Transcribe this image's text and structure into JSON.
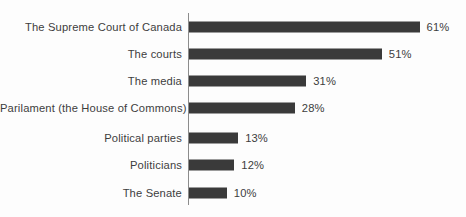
{
  "chart_data": {
    "type": "bar",
    "orientation": "horizontal",
    "title": "",
    "subtitle": "",
    "xlabel": "",
    "ylabel": "",
    "grid": false,
    "legend": null,
    "axis_line": true,
    "value_suffix": "%",
    "xlim": [
      0,
      61
    ],
    "categories": [
      "The Supreme Court of Canada",
      "The courts",
      "The media",
      "Parilament (the House of Commons)",
      "Political parties",
      "Politicians",
      "The Senate"
    ],
    "values": [
      61,
      51,
      31,
      28,
      13,
      12,
      10
    ],
    "value_labels": [
      "61%",
      "51%",
      "31%",
      "28%",
      "13%",
      "12%",
      "10%"
    ],
    "colors": {
      "bar": "#3a3a3a",
      "text": "#3d3d3d",
      "axis": "#8c8c8c",
      "background": "#fdfdfd"
    }
  }
}
